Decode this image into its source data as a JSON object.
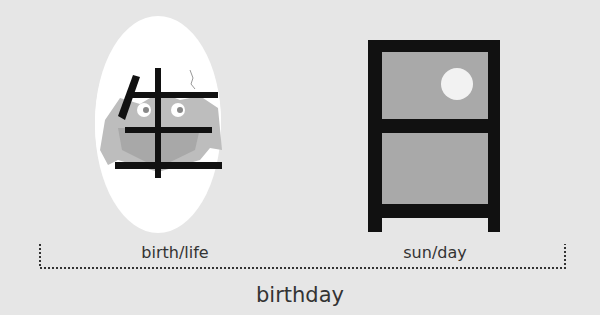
{
  "diagram": {
    "components": [
      {
        "kanji": "生",
        "meaning": "birth/life",
        "illustration": "hatching-chick-egg"
      },
      {
        "kanji": "日",
        "meaning": "sun/day",
        "illustration": "window-with-sun"
      }
    ],
    "compound_meaning": "birthday",
    "colors": {
      "background": "#e6e6e6",
      "ink": "#111111",
      "gray": "#a8a8a8",
      "white": "#ffffff"
    }
  }
}
